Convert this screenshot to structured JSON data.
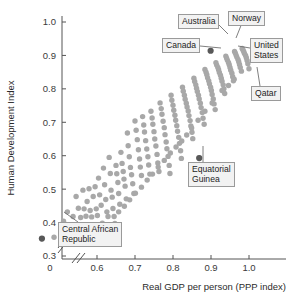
{
  "chart_data": {
    "type": "scatter",
    "title": "",
    "xlabel": "Real GDP per person (PPP index)",
    "ylabel": "Human Development Index",
    "xlim": [
      0.42,
      1.07
    ],
    "ylim": [
      0.27,
      1.03
    ],
    "xticks": [
      0.6,
      0.7,
      0.8,
      0.9,
      1.0
    ],
    "xticklabels": [
      "0.6",
      "0.7",
      "0.8",
      "0.9",
      "1.0"
    ],
    "yticks": [
      0.3,
      0.4,
      0.5,
      0.6,
      0.7,
      0.8,
      0.9,
      1.0
    ],
    "yticklabels": [
      "0.3",
      "0.4",
      "0.5",
      "0.6",
      "0.7",
      "0.8",
      "0.9",
      "1.0"
    ],
    "origin_label": "0",
    "axis_break": true,
    "grid": false,
    "legend": "none",
    "point_color": "#a8a8a8",
    "highlight_color": "#585858",
    "points": [
      [
        0.455,
        0.352
      ],
      [
        0.487,
        0.356
      ],
      [
        0.512,
        0.404
      ],
      [
        0.522,
        0.432
      ],
      [
        0.537,
        0.418
      ],
      [
        0.545,
        0.478
      ],
      [
        0.551,
        0.443
      ],
      [
        0.557,
        0.415
      ],
      [
        0.563,
        0.497
      ],
      [
        0.566,
        0.441
      ],
      [
        0.571,
        0.419
      ],
      [
        0.574,
        0.463
      ],
      [
        0.579,
        0.501
      ],
      [
        0.582,
        0.436
      ],
      [
        0.586,
        0.417
      ],
      [
        0.59,
        0.478
      ],
      [
        0.595,
        0.507
      ],
      [
        0.598,
        0.441
      ],
      [
        0.601,
        0.421
      ],
      [
        0.604,
        0.533
      ],
      [
        0.607,
        0.483
      ],
      [
        0.611,
        0.452
      ],
      [
        0.614,
        0.398
      ],
      [
        0.617,
        0.563
      ],
      [
        0.62,
        0.513
      ],
      [
        0.623,
        0.469
      ],
      [
        0.626,
        0.432
      ],
      [
        0.629,
        0.418
      ],
      [
        0.632,
        0.595
      ],
      [
        0.635,
        0.547
      ],
      [
        0.637,
        0.497
      ],
      [
        0.64,
        0.476
      ],
      [
        0.642,
        0.442
      ],
      [
        0.645,
        0.418
      ],
      [
        0.647,
        0.397
      ],
      [
        0.65,
        0.571
      ],
      [
        0.652,
        0.546
      ],
      [
        0.655,
        0.52
      ],
      [
        0.657,
        0.487
      ],
      [
        0.66,
        0.455
      ],
      [
        0.663,
        0.61
      ],
      [
        0.666,
        0.577
      ],
      [
        0.669,
        0.553
      ],
      [
        0.671,
        0.53
      ],
      [
        0.674,
        0.509
      ],
      [
        0.677,
        0.471
      ],
      [
        0.68,
        0.668
      ],
      [
        0.682,
        0.63
      ],
      [
        0.685,
        0.597
      ],
      [
        0.688,
        0.565
      ],
      [
        0.691,
        0.543
      ],
      [
        0.694,
        0.516
      ],
      [
        0.697,
        0.487
      ],
      [
        0.7,
        0.704
      ],
      [
        0.703,
        0.676
      ],
      [
        0.706,
        0.648
      ],
      [
        0.709,
        0.618
      ],
      [
        0.712,
        0.59
      ],
      [
        0.714,
        0.566
      ],
      [
        0.717,
        0.541
      ],
      [
        0.72,
        0.717
      ],
      [
        0.723,
        0.692
      ],
      [
        0.725,
        0.671
      ],
      [
        0.728,
        0.645
      ],
      [
        0.731,
        0.62
      ],
      [
        0.734,
        0.597
      ],
      [
        0.736,
        0.572
      ],
      [
        0.739,
        0.545
      ],
      [
        0.742,
        0.733
      ],
      [
        0.745,
        0.713
      ],
      [
        0.747,
        0.694
      ],
      [
        0.75,
        0.672
      ],
      [
        0.752,
        0.65
      ],
      [
        0.755,
        0.629
      ],
      [
        0.758,
        0.604
      ],
      [
        0.76,
        0.578
      ],
      [
        0.763,
        0.553
      ],
      [
        0.766,
        0.758
      ],
      [
        0.769,
        0.741
      ],
      [
        0.771,
        0.724
      ],
      [
        0.774,
        0.703
      ],
      [
        0.777,
        0.684
      ],
      [
        0.779,
        0.663
      ],
      [
        0.782,
        0.641
      ],
      [
        0.784,
        0.621
      ],
      [
        0.787,
        0.598
      ],
      [
        0.79,
        0.571
      ],
      [
        0.792,
        0.547
      ],
      [
        0.795,
        0.781
      ],
      [
        0.797,
        0.766
      ],
      [
        0.8,
        0.751
      ],
      [
        0.802,
        0.736
      ],
      [
        0.805,
        0.721
      ],
      [
        0.807,
        0.706
      ],
      [
        0.81,
        0.69
      ],
      [
        0.812,
        0.673
      ],
      [
        0.815,
        0.655
      ],
      [
        0.817,
        0.637
      ],
      [
        0.82,
        0.615
      ],
      [
        0.822,
        0.592
      ],
      [
        0.825,
        0.805
      ],
      [
        0.827,
        0.793
      ],
      [
        0.83,
        0.781
      ],
      [
        0.832,
        0.769
      ],
      [
        0.835,
        0.757
      ],
      [
        0.837,
        0.746
      ],
      [
        0.84,
        0.734
      ],
      [
        0.842,
        0.72
      ],
      [
        0.845,
        0.705
      ],
      [
        0.847,
        0.689
      ],
      [
        0.85,
        0.67
      ],
      [
        0.852,
        0.651
      ],
      [
        0.855,
        0.832
      ],
      [
        0.857,
        0.822
      ],
      [
        0.86,
        0.812
      ],
      [
        0.862,
        0.802
      ],
      [
        0.864,
        0.792
      ],
      [
        0.867,
        0.781
      ],
      [
        0.869,
        0.77
      ],
      [
        0.872,
        0.757
      ],
      [
        0.874,
        0.744
      ],
      [
        0.877,
        0.729
      ],
      [
        0.879,
        0.712
      ],
      [
        0.882,
        0.694
      ],
      [
        0.884,
        0.858
      ],
      [
        0.887,
        0.85
      ],
      [
        0.889,
        0.842
      ],
      [
        0.891,
        0.833
      ],
      [
        0.894,
        0.824
      ],
      [
        0.896,
        0.815
      ],
      [
        0.899,
        0.805
      ],
      [
        0.901,
        0.795
      ],
      [
        0.903,
        0.783
      ],
      [
        0.906,
        0.77
      ],
      [
        0.908,
        0.755
      ],
      [
        0.911,
        0.738
      ],
      [
        0.913,
        0.878
      ],
      [
        0.915,
        0.871
      ],
      [
        0.918,
        0.864
      ],
      [
        0.92,
        0.857
      ],
      [
        0.922,
        0.849
      ],
      [
        0.925,
        0.841
      ],
      [
        0.927,
        0.832
      ],
      [
        0.929,
        0.823
      ],
      [
        0.932,
        0.812
      ],
      [
        0.934,
        0.8
      ],
      [
        0.936,
        0.786
      ],
      [
        0.939,
        0.898
      ],
      [
        0.941,
        0.892
      ],
      [
        0.943,
        0.886
      ],
      [
        0.946,
        0.879
      ],
      [
        0.948,
        0.872
      ],
      [
        0.95,
        0.864
      ],
      [
        0.952,
        0.856
      ],
      [
        0.955,
        0.847
      ],
      [
        0.957,
        0.836
      ],
      [
        0.959,
        0.824
      ],
      [
        0.962,
        0.912
      ],
      [
        0.964,
        0.907
      ],
      [
        0.966,
        0.901
      ],
      [
        0.968,
        0.895
      ],
      [
        0.971,
        0.888
      ],
      [
        0.973,
        0.881
      ],
      [
        0.975,
        0.873
      ],
      [
        0.977,
        0.864
      ],
      [
        0.98,
        0.853
      ],
      [
        0.982,
        0.921
      ],
      [
        0.984,
        0.917
      ],
      [
        0.986,
        0.912
      ],
      [
        0.988,
        0.906
      ],
      [
        0.991,
        0.9
      ],
      [
        0.993,
        0.893
      ],
      [
        0.995,
        0.885
      ],
      [
        0.997,
        0.875
      ],
      [
        1.0,
        0.86
      ],
      [
        0.869,
        0.593
      ],
      [
        0.946,
        0.81
      ],
      [
        0.961,
        0.829
      ],
      [
        0.929,
        0.795
      ],
      [
        0.903,
        0.758
      ],
      [
        0.884,
        0.733
      ],
      [
        0.866,
        0.706
      ],
      [
        0.849,
        0.683
      ],
      [
        0.836,
        0.662
      ],
      [
        0.823,
        0.644
      ],
      [
        0.808,
        0.626
      ],
      [
        0.793,
        0.608
      ],
      [
        0.777,
        0.586
      ],
      [
        0.761,
        0.566
      ],
      [
        0.746,
        0.545
      ],
      [
        0.732,
        0.527
      ],
      [
        0.717,
        0.506
      ],
      [
        0.701,
        0.488
      ],
      [
        0.686,
        0.468
      ],
      [
        0.672,
        0.449
      ],
      [
        0.657,
        0.432
      ]
    ],
    "highlight_points": [
      {
        "label": "Canada",
        "x": 0.899,
        "y": 0.914
      },
      {
        "label": "Central African Republic",
        "x": 0.455,
        "y": 0.352
      },
      {
        "label": "Equatorial Guinea",
        "x": 0.869,
        "y": 0.593
      }
    ]
  },
  "axis": {
    "ylabel": "Human Development Index",
    "xlabel": "Real GDP per person (PPP index)",
    "origin": "0",
    "yticks": [
      "1.0",
      "0.9",
      "0.8",
      "0.7",
      "0.6",
      "0.5",
      "0.4",
      "0.3"
    ],
    "xticks": [
      "0.6",
      "0.7",
      "0.8",
      "0.9",
      "1.0"
    ]
  },
  "callouts": {
    "australia": "Australia",
    "norway": "Norway",
    "canada": "Canada",
    "united_states": "United\nStates",
    "qatar": "Qatar",
    "equatorial_guinea": "Equatorial\nGuinea",
    "central_african_republic": "Central African\nRepublic"
  }
}
